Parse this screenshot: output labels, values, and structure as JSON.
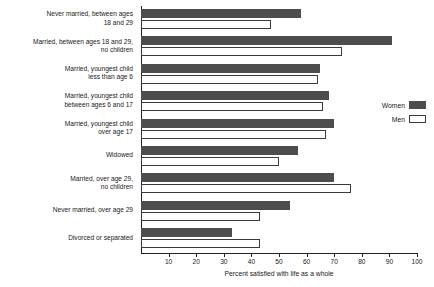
{
  "chart_data": {
    "type": "bar",
    "orientation": "horizontal",
    "title": "",
    "xlabel": "Percent satisfied with life as a whole",
    "ylabel": "",
    "xlim": [
      0,
      100
    ],
    "xticks": [
      10,
      20,
      30,
      40,
      50,
      60,
      70,
      80,
      90,
      100
    ],
    "grid": false,
    "legend_position": "right",
    "categories": [
      "Never married, between ages 18 and 29",
      "Married, between ages 18 and 29, no children",
      "Married, youngest child less than age 6",
      "Married, youngest child between ages 6 and 17",
      "Married, youngest child over age 17",
      "Widowed",
      "Married, over age 29, no children",
      "Never married, over age 29",
      "Divorced or separated"
    ],
    "category_lines": [
      [
        "Never married, between ages",
        "18 and 29"
      ],
      [
        "Married, between ages 18 and 29,",
        "no children"
      ],
      [
        "Married, youngest child",
        "less than age 6"
      ],
      [
        "Married, youngest child",
        "between ages 6 and 17"
      ],
      [
        "Married, youngest child",
        "over age 17"
      ],
      [
        "Widowed"
      ],
      [
        "Married, over age 29,",
        "no children"
      ],
      [
        "Never married, over age 29"
      ],
      [
        "Divorced or separated"
      ]
    ],
    "series": [
      {
        "name": "Women",
        "color": "#4d4d4d",
        "values": [
          58,
          91,
          65,
          68,
          70,
          57,
          70,
          54,
          33
        ]
      },
      {
        "name": "Men",
        "color": "#ffffff",
        "values": [
          47,
          73,
          64,
          66,
          67,
          50,
          76,
          43,
          43
        ]
      }
    ]
  },
  "legend": {
    "items": [
      {
        "label": "Women"
      },
      {
        "label": "Men"
      }
    ]
  }
}
